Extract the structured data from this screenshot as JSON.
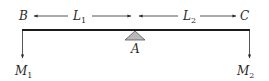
{
  "diagram": {
    "type": "lever-beam-with-fulcrum",
    "labels": {
      "left_end": "B",
      "right_end": "C",
      "pivot": "A",
      "left_length": "L",
      "left_length_sub": "1",
      "right_length": "L",
      "right_length_sub": "2",
      "left_mass": "M",
      "left_mass_sub": "1",
      "right_mass": "M",
      "right_mass_sub": "2"
    },
    "colors": {
      "beam": "#1a1a1a",
      "support_fill": "#b8b8b8",
      "support_stroke": "#555555",
      "text": "#2a2a2a"
    }
  }
}
